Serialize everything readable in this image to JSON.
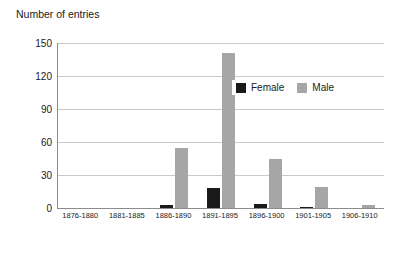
{
  "chart_data": {
    "type": "bar",
    "title": "Number of entries",
    "xlabel": "",
    "ylabel": "",
    "ylim": [
      0,
      150
    ],
    "yticks": [
      0,
      30,
      60,
      90,
      120,
      150
    ],
    "grid": true,
    "legend_position": "upper-right-inside",
    "categories": [
      "1876-1880",
      "1881-1885",
      "1886-1890",
      "1891-1895",
      "1896-1900",
      "1901-1905",
      "1906-1910"
    ],
    "series": [
      {
        "name": "Female",
        "color": "#1a1a1a",
        "values": [
          0,
          0,
          3,
          18,
          4,
          1,
          0
        ]
      },
      {
        "name": "Male",
        "color": "#a6a6a6",
        "values": [
          0,
          0,
          55,
          141,
          45,
          19,
          3
        ]
      }
    ]
  },
  "legend": {
    "items": [
      {
        "label": "Female"
      },
      {
        "label": "Male"
      }
    ]
  }
}
